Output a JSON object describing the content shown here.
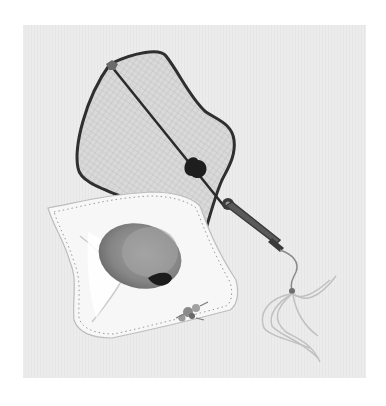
{
  "illustration": {
    "subject": "Watercolor still life of a handheld silk fan with tassel resting on a folded embroidered handkerchief holding a fuzzy fruit",
    "style": "grayscale watercolor",
    "colors": {
      "background_panel": "#e9e9e9",
      "page": "#ffffff",
      "fan_frame": "#3a3a3a",
      "fan_mesh": "#d4d4d4",
      "ornament": "#1e1e1e",
      "handkerchief": "#f6f6f6",
      "fruit": "#8a8a8a",
      "tassel": "#c8c8c8"
    },
    "elements": [
      "fan",
      "fan-handle",
      "tassel",
      "handkerchief",
      "fruit",
      "embroidered-flower"
    ]
  }
}
